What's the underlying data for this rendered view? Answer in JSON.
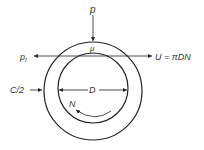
{
  "labels": {
    "load": "p",
    "viscosity": "μ",
    "friction": "p",
    "friction_sub": "f",
    "velocity": "U = πDN",
    "clearance": "C/2",
    "diameter": "D",
    "speed": "N"
  },
  "colors": {
    "stroke": "#222222",
    "text": "#333333"
  }
}
